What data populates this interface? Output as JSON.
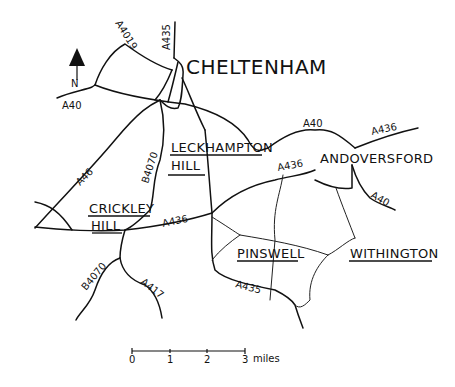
{
  "map": {
    "town": "CHELTENHAM",
    "places": {
      "leckhampton_1": "LECKHAMPTON",
      "leckhampton_2": "HILL",
      "crickley_1": "CRICKLEY",
      "crickley_2": "HILL",
      "andoversford": "ANDOVERSFORD",
      "pinswell": "PINSWELL",
      "withington": "WITHINGTON"
    },
    "roads": {
      "a4019": "A4019",
      "a435_north": "A435",
      "a40_west": "A40",
      "a40_east": "A40",
      "a436_northeast": "A436",
      "a436_middle": "A436",
      "a436_west": "A436",
      "a40_southeast": "A40",
      "a46": "A46",
      "b4070_north": "B4070",
      "b4070_south": "B4070",
      "a417": "A417",
      "a435_south": "A435"
    },
    "north_arrow": {
      "label": "N",
      "icon": "north-arrow-icon"
    },
    "scale_bar": {
      "ticks": [
        "0",
        "1",
        "2",
        "3"
      ],
      "unit": "miles"
    }
  }
}
